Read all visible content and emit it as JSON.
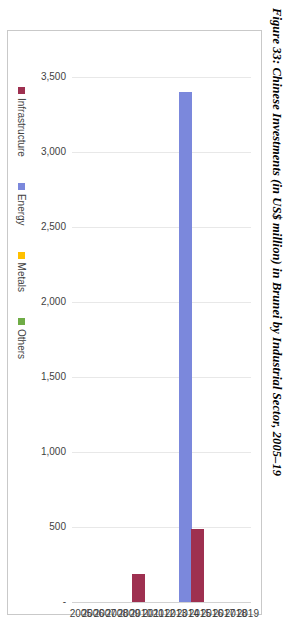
{
  "figure": {
    "title": "Figure 33: Chinese Investments (in US$ million) in Brunei by Industrial Sector, 2005–19"
  },
  "legend": {
    "position": "bottom",
    "items": [
      {
        "label": "Infrastructure",
        "color": "#9E3050"
      },
      {
        "label": "Energy",
        "color": "#7B88DC"
      },
      {
        "label": "Metals",
        "color": "#FFC000"
      },
      {
        "label": "Others",
        "color": "#6FAC46"
      }
    ]
  },
  "chart_data": {
    "type": "bar",
    "orientation": "vertical",
    "title": "Figure 33: Chinese Investments (in US$ million) in Brunei by Industrial Sector, 2005–19",
    "xlabel": "",
    "ylabel": "",
    "ylim": [
      0,
      3500
    ],
    "grid": true,
    "ytick_labels": [
      "-",
      "500",
      "1,000",
      "1,500",
      "2,000",
      "2,500",
      "3,000",
      "3,500"
    ],
    "ytick_values": [
      0,
      500,
      1000,
      1500,
      2000,
      2500,
      3000,
      3500
    ],
    "categories": [
      "2005",
      "2006",
      "2007",
      "2008",
      "2009",
      "2010",
      "2011",
      "2012",
      "2013",
      "2014",
      "2015",
      "2016",
      "2017",
      "2018",
      "2019"
    ],
    "series": [
      {
        "name": "Infrastructure",
        "color": "#9E3050",
        "values": [
          0,
          0,
          0,
          0,
          0,
          190,
          0,
          0,
          0,
          0,
          490,
          0,
          0,
          0,
          0
        ]
      },
      {
        "name": "Energy",
        "color": "#7B88DC",
        "values": [
          0,
          0,
          0,
          0,
          0,
          0,
          0,
          0,
          0,
          3400,
          0,
          0,
          0,
          0,
          0
        ]
      },
      {
        "name": "Metals",
        "color": "#FFC000",
        "values": [
          0,
          0,
          0,
          0,
          0,
          0,
          0,
          0,
          0,
          0,
          0,
          0,
          0,
          0,
          0
        ]
      },
      {
        "name": "Others",
        "color": "#6FAC46",
        "values": [
          0,
          0,
          0,
          0,
          0,
          0,
          0,
          0,
          0,
          0,
          0,
          0,
          0,
          0,
          0
        ]
      }
    ]
  }
}
